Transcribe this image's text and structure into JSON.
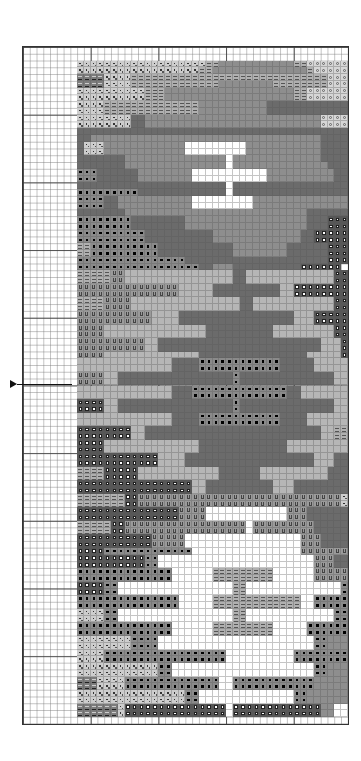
{
  "chart_data": {
    "type": "table",
    "title": "",
    "grid": {
      "columns": 48,
      "rows": 100,
      "major_every": 10,
      "cell_px": 6.77,
      "origin_px": [
        22,
        46
      ]
    },
    "pattern_col_offset": 8,
    "pattern_row_offset": 2,
    "legend": {
      ".": "empty",
      "d": "dotted light grey",
      "v": "VV dark grey",
      "e": "double-dash light grey",
      "o": "circle on light grey",
      "D": "dark grey solid",
      "M": "medium grey solid",
      "L": "light grey solid",
      "b": "black dot on grey",
      "s": "white square on dark grey",
      "u": "U-symbol medium grey",
      "w": "white"
    },
    "colors": {
      "d": "#cdcdcd",
      "v": "#7c7c7c",
      "e": "#b0b0b0",
      "o": "#d6d6d6",
      "D": "#6b6b6b",
      "M": "#8e8e8e",
      "L": "#b6b6b6",
      "b": "#8a8a8a",
      "s": "#575757",
      "u": "#9a9a9a",
      "w": "#ffffff"
    },
    "rows": [
      "dddddddddddddddddddeeMMMMMMMMMMMeeoooooo",
      "ddddddddddddddddddeeMMMMMMMMMMMMMMeooooo",
      "vvvvddddeeeeeeeeeeeeeeeeeeeeeeeeeeeeeooo",
      "vvvvddddeeeeeeeeeeeeeMMMMMMMMeeeeeeeeooo",
      "ddddddddddeeeMMMMMMMMMMMMMMMMMMMeeoooooo",
      "ddddddddddeeeMMMMMMMMMMMMMMMMMMMeeoooooo",
      "ddddeeeeeeeeeeeeeeMMMMMMMMMMDDDDDDDDDDDD",
      "ddddeeeeeeeeeeeeeeMMMMMMMMMMDDDDDDDDDDDD",
      "ddddddddDDMMMMMMMMMMMMMMMMMMMMMMMMMMoooo",
      "ddddddddDDMMMMMMMMMMMMMMMMMMMMMMMMMMoooo",
      "DDDDDDDDDDDDDDDDDDDDDDDDDDDDDDDDDDDDDDDD",
      "DDMMMMMMMMMMMMMMMMMMMMMMMMMMMMMMMMMMDDDD",
      "DdddMMMMMMMMMMMMwwwwwwwwwMMMMMMMMMMMDDDD",
      "DdddMMMMMMMMMMMMwwwwwwwwwMMMMMMMMMMMDDDD",
      "DDDDDDDMMMMMMMMMMMMMMMwMMMMMMMMMMMMMDDDD",
      "DDDDDDDMMMMMMMMMMMMMMMwMMMMMMMMMMMMMMDDD",
      "bbbDDDDDDMMMMMMMMwwwwwwwwwwwMMMMMMMMMMDD",
      "bbbDDDDDDMMMMMMMMwwwwwwwwwwwMMMMMMMMMMDD",
      "DDDDDDDDDDDDDDDDDDDDDDwDDDDDDDDDDDDDDDDD",
      "bbbbbbbbbDDDDDDDDDDDDDwDDDDDDDDDDDDDDDDD",
      "bbbbDDMMMMMMMMMMMwwwwwwwwwMMMMMMMMMMMMMM",
      "bbbbDDMMMMMMMMMMMwwwwwwwwwMMMMMMMMMMMMMM",
      "DDDDDDDMMMMMMMMMMMMMMMMMMMMMMMMMMMDDDDDD",
      "bbbbbbbbDDDDDDDDMMMMMMMMMMMMMMMMMMDDDsss",
      "bbbbbbbbDDDDDDDDMMMMMMMMMMMMMMMMMMDDDsss",
      "bbbbbbbbbbDDDDDDDDDDMMMMMMMMMMMMMDDsssss",
      "bbbbbbbbbbDDDDDDDDDDMMMMMMMMMMMMMDDsssss",
      "eebbbbbbbbbbDDDDDDDDDDDMMMMMMMMDDDDDDsss",
      "eebbbbbbbbbbDDDDDDDDDDDMMMMMMMMDDDDDDsss",
      "bbbbbbbbbbbbbbbbDDDDDDDDDDDDDDDDDDDDDsss",
      "bbbbbbbbbbbbbbbbbbDDMMMDDDDDDDDDDssssss",
      "eeeeeuuLLLLLLLLLLLLLLLLDDLLLLLLLLLLLLLsso",
      "eeeeeuuLLLLLLLLLLLLLLLLDDLLLLLLLLLLLLLsso",
      "uuuuuuuuuuuuuuuLLLLLDDDDDDDDDDLLssssssss",
      "uuuuuuuuuuuuuuuLLLLLDDDDDDDDDDLLssssssss",
      "eeeeuuuuLLLLLLLLLLLLLLLLDDLLLLLLLLLLLLss",
      "eeeeuuuuLLLLLLLLLLLLLLLLDDLLLLLLLLLLLLss",
      "uuuuuuuuuuuLLLLDDDDDDDDDDDDDDDDDLLLsssss",
      "uuuuuuuuuuuLLLLDDDDDDDDDDDDDDDDDLLLsssss",
      "uuuuLLLLLLLLLLLLLLLDDDDDDDDDDLLLLLLLLLss",
      "uuuuLLLLLLLLLLLLLLLDDDDDDDDDDLLLLLLLLLss",
      "uuuuuuuuuuLLDDDDDDDDDDDDDDDDDDDDDDDDLLLss",
      "uuuuuuuuuuLLDDDDDDDDDDDDDDDDDDDDDDDDLLLss",
      "uuuuLLLLLLLLLLLLLLDDDDDDDDDDDDDDDDLLLLLs",
      "LLLLLLLLLLLLLLDDDDbbbbbbbbbbbbDDDDDLLLLLL",
      "LLLLLLLLLLLLLLDDDDbbbbbbbbbbbbDDDDDLLLLLL",
      "uuuuLLDDDDDDDDDDDDDDDDDbDDDDDDDDDDDDDDLLL",
      "uuuuLLDDDDDDDDDDDDDDDDDbDDDDDDDDDDDDDDLLL",
      "LLLLLLLLLLLLLLDDDbbbbbbbbbbbbbbDDLLLLLLL",
      "LLLLLLLLLLLLLLDDDbbbbbbbbbbbbbbDDLLLLLLL",
      "ssssLLDDDDDDDDDDDDDDDDDbDDDDDDDDDDDDDDLLL",
      "ssssLLDDDDDDDDDDDDDDDDDbDDDDDDDDDDDDDDLLL",
      "LLLLLLLLLLLLLLDDDDbbbbbbbbbbbbDDDDLLLLLLL",
      "LLLLLLLLLLLLLLDDDDbbbbbbbbbbbbDDDDLLLLLLL",
      "ssssssssLLDDDDDDDDDDDDDDDDDDDDDDDDDDLLeee",
      "ssssssssLLDDDDDDDDDDDDDDDDDDDDDDDDDDLLeee",
      "ssssLLLLLLLLLLLLLLDDDDDDDDDDDDDLLLLLLLLL",
      "ssssLLLLLLLLLLLLLLDDDDDDDDDDDDDLLLLLLLLL",
      "ssssssssssssLLLLDDDDDDDDDDDDDDDDDDDLLLDDDD",
      "ssssssssssssLLLLDDDDDDDDDDDDDDDDDDDLLLDDDD",
      "eeeesssssLLLLLLLLLLLLDDDDDDLLLLLLLLLLDDDD",
      "eeeesssssLLLLLLLLLLLLDDDDDDLLLLLLLLLLDDDD",
      "sssssssssssssssssLLDDDDDDDDDDLLLDDDDDDDDD",
      "sssssssssssssssssLLDDDDDDDDDDLLLDDDDDDDDD",
      "eeeeeeessuuuuuuuuuuuuuuuuuuuuuuuuuuuuuud",
      "eeeeeeessuuuuuuuuuuuuuuuuuuuuuuuuuuuuuud",
      "sssssssssssssssuuuuwwwwwwwwwwwwuuuDDDDDD",
      "sssssssssssssssuuuuwwwwwwwwwwwwuuuDDDDDD",
      "eeeeessuuuuuuuuuuuuuuuuuuwuuuuuuuuuDDDDDD",
      "eeeeessuuuuuuuuuuuuuuuuuuwuuuuuuuuuDDDDDD",
      "sssssssssssuuuuuwwwwwwwwwwwwwwwwwuuuDDDDD",
      "sssssssssssuuuuuwwwwwwwwwwwwwwwwwuuuDDDDD",
      "ssssbbbbbbbbbbbbbwwwwwwwwwwwwwwwwuuuuuuuu",
      "ssssssssssbbwwwwwwwwwwwwwwwwwwwwwwwuuuDDD",
      "ssssssssssbbwwwwwwwwwwwwwwwwwwwwwwwuuuDDD",
      "bbbbbbbbbbbbbbwwwwwweeeeeeeeewwwwwwuuuuuu",
      "bbbbbbbbbbbbbbwwwwwweeeeeeeeewwwwwwuuuuuu",
      "ssssbbwwwwwwwwwwwwwwwwweewwwwwwwwwwwwwwbb",
      "ssssbbwwwwwwwwwwwwwwwwweewwwwwwwwwwwwwwbb",
      "bbbbbbbbbbbbbbbwwwwweeeeeeeeeeeeewwbbbbbbb",
      "bbbbbbbbbbbbbbbwwwwweeeeeeeeeeeeewwbbbbbbb",
      "ddddbbwwwwwwwwwwwwwwwwweewwwwwwwwwwwwwbb",
      "ddddbbwwwwwwwwwwwwwwwwweewwwwwwwwwwwwwbb",
      "bbbbbbbbbbbbbbwwwwwweeeeeeeeewwwwwbbbbbbbb",
      "bbbbbbbbbbbbbbwwwwwweeeeeeeeewwwwwbbbbbbbb",
      "ddddddddbbbbwwwwwwwwwwwwwwwwwwwwwwwbbMMMM",
      "ddddddddbbbbwwwwwwwwwwwwwwwwwwwwwwwbbMMMM",
      "ddddbbbbbbbbbbbbbbbbbbwwwwwwwwwwbbbbbbbbbbb",
      "ddddbbbbbbbbbbbbbbbbbbwwwwwwwwwwbbbbbbbbbbb",
      "ddddddddddddbbwwwwwwwwwwwwwwwwwwwwwbbMMMMM",
      "ddddddddddddbbwwwwwwwwwwwwwwwwwwwwwbbMMMMM",
      "vvvddddbbbbbbbbbbbbbbwwbbbbbbbbbbbbMMMMMM",
      "vvvddddbbbbbbbbbbbbbbwwbbbbbbbbbbbbMMMMMM",
      "ddddddddddddddddbbwwwwwwwwwwwwwwbbMMMMMMM",
      "ddddddddddddddddbbwwwwwwwwwwwwwwbbMMMMMMM",
      "vvvvvvdssssssssssssssswsssssssssssssMMwww",
      "vvvvvvdssssssssssssssswsssssssssssssMMwww",
      "........................................"
    ]
  },
  "marker": {
    "symbol": "right-arrow",
    "row": 49
  }
}
